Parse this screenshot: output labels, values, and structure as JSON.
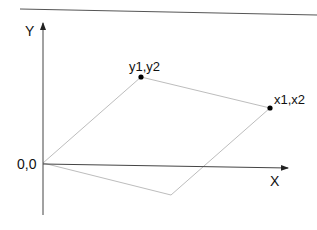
{
  "diagram": {
    "axes": {
      "x_label": "X",
      "y_label": "Y",
      "origin_label": "0,0"
    },
    "points": [
      {
        "label": "y1,y2",
        "x": 141,
        "y": 77
      },
      {
        "label": "x1,x2",
        "x": 270,
        "y": 108
      }
    ],
    "parallelogram_vertices": [
      {
        "x": 43,
        "y": 163
      },
      {
        "x": 141,
        "y": 77
      },
      {
        "x": 270,
        "y": 108
      },
      {
        "x": 171,
        "y": 195
      }
    ],
    "colors": {
      "axis": "#333333",
      "edges": "#bdbdbd",
      "top_line": "#555555",
      "points": "#000000"
    }
  }
}
